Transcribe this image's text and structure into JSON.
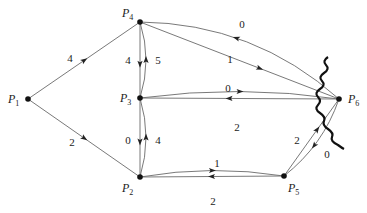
{
  "figure": {
    "type": "directed-network",
    "nodes": [
      {
        "id": "P1",
        "label": "P",
        "sub": "1"
      },
      {
        "id": "P2",
        "label": "P",
        "sub": "2"
      },
      {
        "id": "P3",
        "label": "P",
        "sub": "3"
      },
      {
        "id": "P4",
        "label": "P",
        "sub": "4"
      },
      {
        "id": "P5",
        "label": "P",
        "sub": "5"
      },
      {
        "id": "P6",
        "label": "P",
        "sub": "6"
      }
    ],
    "edges": [
      {
        "from": "P1",
        "to": "P4",
        "weight": "4"
      },
      {
        "from": "P1",
        "to": "P2",
        "weight": "2"
      },
      {
        "from": "P4",
        "to": "P3",
        "weight": "4"
      },
      {
        "from": "P3",
        "to": "P4",
        "weight": "5"
      },
      {
        "from": "P3",
        "to": "P2",
        "weight": "0"
      },
      {
        "from": "P2",
        "to": "P3",
        "weight": "4"
      },
      {
        "from": "P6",
        "to": "P4",
        "weight": "0"
      },
      {
        "from": "P4",
        "to": "P6",
        "weight": "1"
      },
      {
        "from": "P6",
        "to": "P3",
        "weight": "0"
      },
      {
        "from": "P3",
        "to": "P6",
        "weight": "2"
      },
      {
        "from": "P5",
        "to": "P2",
        "weight": "1"
      },
      {
        "from": "P2",
        "to": "P5",
        "weight": "2"
      },
      {
        "from": "P5",
        "to": "P6",
        "weight": "2"
      },
      {
        "from": "P6",
        "to": "P5",
        "weight": "0"
      }
    ],
    "cut_marker": "wavy-cut-line-near-P6"
  }
}
